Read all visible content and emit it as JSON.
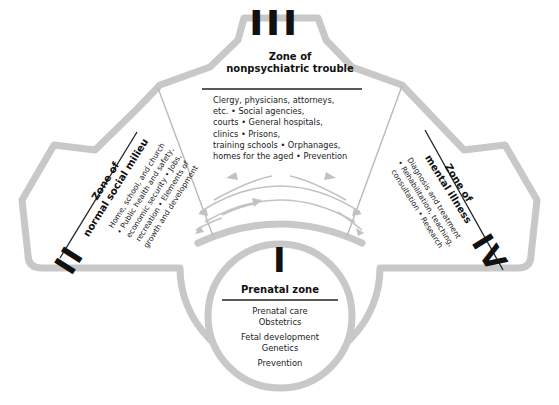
{
  "diagram": {
    "type": "concentric zone diagram",
    "colors": {
      "outline": "#c8c8c8",
      "text": "#111111",
      "background": "#ffffff",
      "arrows": "#c2c2c2"
    }
  },
  "zones": {
    "zone3": {
      "numeral": "III",
      "title_line1": "Zone of",
      "title_line2": "nonpsychiatric trouble",
      "body_lines": [
        "Clergy, physicians, attorneys,",
        "etc. • Social agencies,",
        "courts • General hospitals,",
        "clinics • Prisons,",
        "training schools • Orphanages,",
        "homes for the aged • Prevention"
      ]
    },
    "zone2": {
      "numeral": "II",
      "title_line1": "Zone of",
      "title_line2": "normal social milieu",
      "body_lines": [
        "Home, school, and church",
        "• Public health and safety,",
        "economic security • Jobs,",
        "recreation • Elements of",
        "growth and development"
      ]
    },
    "zone4": {
      "numeral": "IV",
      "title_line1": "Zone of",
      "title_line2": "mental illness",
      "body_lines": [
        "Diagnosis and treatment",
        "• Rehabilitation, teaching,",
        "consultation • Research"
      ]
    },
    "zone1": {
      "numeral": "I",
      "title": "Prenatal zone",
      "items": [
        "Prenatal care",
        "Obstetrics",
        "Fetal development",
        "Genetics",
        "Prevention"
      ]
    }
  }
}
